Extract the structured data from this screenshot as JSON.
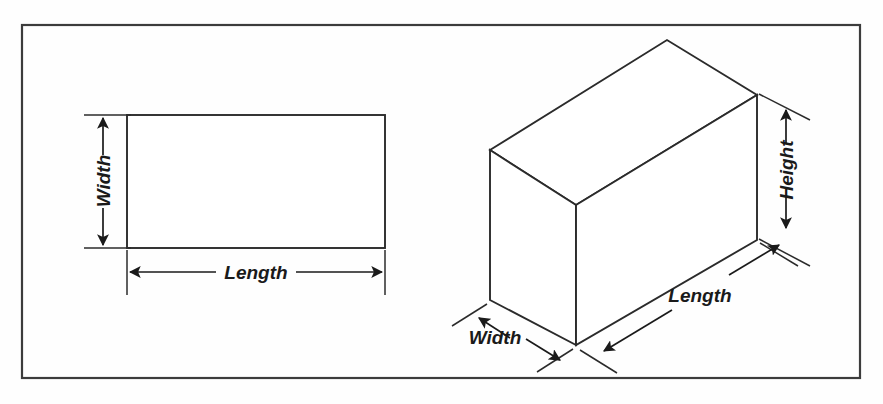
{
  "figure": {
    "title": "",
    "background_color": "#fefefe",
    "frame": {
      "x": 22,
      "y": 25,
      "width": 838,
      "height": 353,
      "stroke_color": "#3c3c3c"
    },
    "line_color": "#2b2b2b",
    "text_color": "#1a1a1a"
  },
  "rectangle_2d": {
    "name": "rectangle",
    "x": 127,
    "y": 115,
    "width": 258,
    "height": 133,
    "dimensions": [
      {
        "id": "rect-width",
        "label": "Width",
        "orientation": "vertical",
        "rotated": true
      },
      {
        "id": "rect-length",
        "label": "Length",
        "orientation": "horizontal",
        "rotated": false
      }
    ]
  },
  "box_3d": {
    "name": "rectangular-prism",
    "vertices": {
      "top_apex": [
        667,
        40
      ],
      "top_left": [
        490,
        150
      ],
      "top_right": [
        757,
        95
      ],
      "top_front": [
        576,
        205
      ],
      "bottom_left": [
        490,
        300
      ],
      "bottom_front": [
        576,
        345
      ],
      "bottom_right": [
        757,
        240
      ]
    },
    "dimensions": [
      {
        "id": "box-height",
        "label": "Height",
        "orientation": "vertical",
        "rotated": true
      },
      {
        "id": "box-length",
        "label": "Length",
        "orientation": "diagonal-right",
        "rotated": false
      },
      {
        "id": "box-width",
        "label": "Width",
        "orientation": "diagonal-left",
        "rotated": false
      }
    ]
  },
  "labels": {
    "rect_width": "Width",
    "rect_length": "Length",
    "box_height": "Height",
    "box_length": "Length",
    "box_width": "Width"
  }
}
